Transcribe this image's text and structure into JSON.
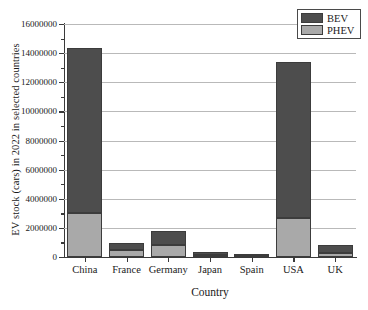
{
  "chart_data": {
    "type": "bar",
    "subtype": "stacked-vertical-bar",
    "title": "",
    "xlabel": "Country",
    "ylabel": "EV stock (cars) in 2022 in selected countries",
    "categories": [
      "China",
      "France",
      "Germany",
      "Japan",
      "Spain",
      "USA",
      "UK"
    ],
    "series": [
      {
        "name": "PHEV",
        "color": "#a9a9a9",
        "values": [
          3020000,
          480000,
          820000,
          130000,
          90000,
          2680000,
          270000
        ]
      },
      {
        "name": "BEV",
        "color": "#4d4d4d",
        "values": [
          11330000,
          480000,
          970000,
          210000,
          120000,
          10710000,
          550000
        ]
      }
    ],
    "totals": [
      14350000,
      960000,
      1790000,
      340000,
      210000,
      13390000,
      820000
    ],
    "ylim": [
      0,
      16000000
    ],
    "ytick_labels": [
      "0",
      "2000000",
      "4000000",
      "6000000",
      "8000000",
      "10000000",
      "12000000",
      "14000000",
      "16000000"
    ],
    "ytick_values": [
      0,
      2000000,
      4000000,
      6000000,
      8000000,
      10000000,
      12000000,
      14000000,
      16000000
    ],
    "ytick_minor_step": 1000000,
    "grid": "horizontal-major-only",
    "legend": {
      "position": "top-right",
      "boxed": true,
      "entries": [
        {
          "label": "BEV",
          "color": "#4d4d4d"
        },
        {
          "label": "PHEV",
          "color": "#a9a9a9"
        }
      ]
    }
  }
}
